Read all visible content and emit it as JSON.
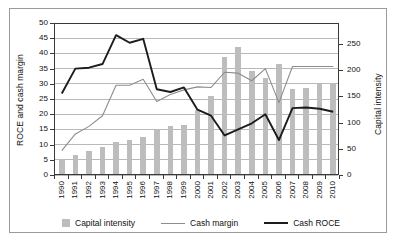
{
  "chart_data": {
    "type": "bar",
    "title": "",
    "subtitle": "",
    "xlabel": "",
    "ylabel": "ROCE and cash margin",
    "y2label": "Capital intensity",
    "grid": true,
    "legend_position": "bottom",
    "ylim": [
      0,
      50
    ],
    "y2lim": [
      0,
      290
    ],
    "yticks": [
      0,
      5,
      10,
      15,
      20,
      25,
      30,
      35,
      40,
      45,
      50
    ],
    "y2ticks": [
      0,
      50,
      100,
      150,
      200,
      250
    ],
    "categories": [
      "1990",
      "1991",
      "1992",
      "1993",
      "1994",
      "1995",
      "1996",
      "1997",
      "1998",
      "1999",
      "2000",
      "2001",
      "2002",
      "2003",
      "2004",
      "2005",
      "2006",
      "2007",
      "2008",
      "2009",
      "2010"
    ],
    "series": [
      {
        "name": "Capital intensity",
        "type": "bar",
        "axis": "right",
        "color": "#bdbdbd",
        "values": [
          29,
          37,
          44,
          52,
          61,
          65,
          70,
          84,
          91,
          93,
          122,
          149,
          224,
          242,
          196,
          184,
          209,
          163,
          165,
          172,
          174
        ]
      },
      {
        "name": "Cash margin",
        "type": "line",
        "axis": "left",
        "color": "#8d8d8d",
        "values": [
          8.0,
          13.5,
          16.0,
          19.5,
          29.5,
          29.5,
          31.5,
          24.2,
          26.5,
          28.0,
          29.0,
          28.8,
          33.8,
          33.5,
          31.0,
          35.0,
          23.8,
          35.7,
          35.7,
          35.7,
          35.7
        ]
      },
      {
        "name": "Cash ROCE",
        "type": "line",
        "axis": "left",
        "color": "#1c1c1c",
        "values": [
          26.8,
          35.0,
          35.3,
          36.5,
          46.0,
          43.5,
          44.8,
          28.2,
          27.3,
          28.8,
          21.5,
          19.5,
          13.0,
          15.0,
          17.0,
          20.0,
          11.5,
          22.0,
          22.2,
          21.8,
          20.8
        ]
      }
    ]
  },
  "axes": {
    "left_title": "ROCE and cash margin",
    "right_title": "Capital intensity"
  },
  "legend": {
    "items": [
      {
        "label": "Capital intensity",
        "marker": "bar-swatch"
      },
      {
        "label": "Cash margin",
        "marker": "line-swatch-light"
      },
      {
        "label": "Cash ROCE",
        "marker": "line-swatch-dark"
      }
    ]
  }
}
